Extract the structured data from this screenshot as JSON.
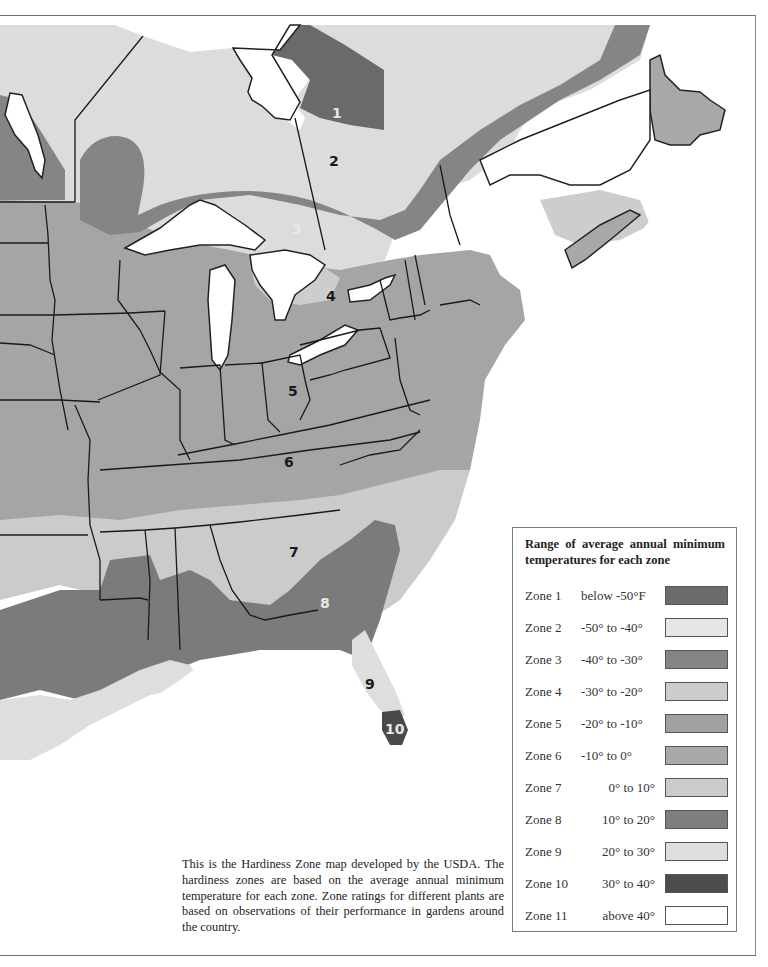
{
  "map": {
    "zone_labels": [
      {
        "text": "1",
        "x": 332,
        "y": 106,
        "tone": "light"
      },
      {
        "text": "2",
        "x": 329,
        "y": 154,
        "tone": "dark"
      },
      {
        "text": "3",
        "x": 292,
        "y": 222,
        "tone": "light"
      },
      {
        "text": "4",
        "x": 326,
        "y": 289,
        "tone": "dark"
      },
      {
        "text": "5",
        "x": 288,
        "y": 384,
        "tone": "dark"
      },
      {
        "text": "6",
        "x": 284,
        "y": 455,
        "tone": "dark"
      },
      {
        "text": "7",
        "x": 289,
        "y": 545,
        "tone": "dark"
      },
      {
        "text": "8",
        "x": 320,
        "y": 596,
        "tone": "light"
      },
      {
        "text": "9",
        "x": 365,
        "y": 677,
        "tone": "dark"
      },
      {
        "text": "10",
        "x": 385,
        "y": 722,
        "tone": "light"
      }
    ]
  },
  "caption": "This is the Hardiness Zone map developed by the USDA. The hardiness zones are based on the average annual minimum temperature for each zone. Zone ratings for different plants are based on observations of their performance in gardens around the country.",
  "legend": {
    "title": "Range of average annual minimum temperatures for each zone",
    "items": [
      {
        "zone": "Zone 1",
        "range": "below -50°F",
        "color": "#6b6b6b",
        "align": "left"
      },
      {
        "zone": "Zone 2",
        "range": "-50° to -40°",
        "color": "#e6e6e6",
        "align": "left"
      },
      {
        "zone": "Zone 3",
        "range": "-40° to -30°",
        "color": "#858585",
        "align": "left"
      },
      {
        "zone": "Zone 4",
        "range": "-30° to -20°",
        "color": "#cdcdcd",
        "align": "left"
      },
      {
        "zone": "Zone 5",
        "range": "-20° to -10°",
        "color": "#a0a0a0",
        "align": "left"
      },
      {
        "zone": "Zone 6",
        "range": "-10° to 0°",
        "color": "#a9a9a9",
        "align": "left"
      },
      {
        "zone": "Zone 7",
        "range": "0° to 10°",
        "color": "#cbcbcb",
        "align": "right"
      },
      {
        "zone": "Zone 8",
        "range": "10° to 20°",
        "color": "#7e7e7e",
        "align": "right"
      },
      {
        "zone": "Zone 9",
        "range": "20° to 30°",
        "color": "#dedede",
        "align": "right"
      },
      {
        "zone": "Zone 10",
        "range": "30° to 40°",
        "color": "#4d4d4d",
        "align": "right"
      },
      {
        "zone": "Zone 11",
        "range": "above 40°",
        "color": "#ffffff",
        "align": "right"
      }
    ]
  }
}
